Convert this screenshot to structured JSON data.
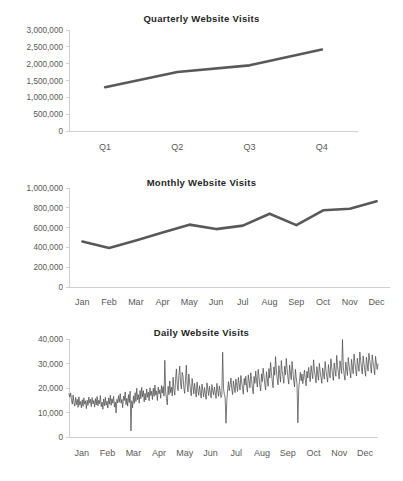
{
  "page": {
    "background": "#ffffff",
    "series_color": "#595959",
    "axis_color": "#d0d0d0",
    "label_color": "#595959"
  },
  "charts": [
    {
      "id": "quarterly",
      "title": "Quarterly Website Visits"
    },
    {
      "id": "monthly",
      "title": "Monthly Website Visits"
    },
    {
      "id": "daily",
      "title": "Daily Website Visits"
    }
  ],
  "chart_data": [
    {
      "type": "line",
      "title": "Quarterly Website Visits",
      "xlabel": "",
      "ylabel": "",
      "categories": [
        "Q1",
        "Q2",
        "Q3",
        "Q4"
      ],
      "values": [
        1300000,
        1750000,
        1950000,
        2420000
      ],
      "ylim": [
        0,
        3000000
      ],
      "ytick_labels": [
        "3,000,000",
        "2,500,000",
        "2,000,000",
        "1,500,000",
        "1,000,000",
        "500,000",
        "0"
      ],
      "yticks": [
        3000000,
        2500000,
        2000000,
        1500000,
        1000000,
        500000,
        0
      ],
      "grid": false,
      "legend": "none"
    },
    {
      "type": "line",
      "title": "Monthly Website Visits",
      "xlabel": "",
      "ylabel": "",
      "categories": [
        "Jan",
        "Feb",
        "Mar",
        "Apr",
        "May",
        "Jun",
        "Jul",
        "Aug",
        "Sep",
        "Oct",
        "Nov",
        "Dec"
      ],
      "values": [
        460000,
        395000,
        470000,
        550000,
        630000,
        585000,
        620000,
        740000,
        625000,
        775000,
        790000,
        865000
      ],
      "ylim": [
        0,
        1000000
      ],
      "ytick_labels": [
        "1,000,000",
        "800,000",
        "600,000",
        "400,000",
        "200,000",
        "0"
      ],
      "yticks": [
        1000000,
        800000,
        600000,
        400000,
        200000,
        0
      ],
      "grid": false,
      "legend": "none"
    },
    {
      "type": "line",
      "title": "Daily Website Visits",
      "xlabel": "",
      "ylabel": "",
      "categories": [
        "Jan",
        "Feb",
        "Mar",
        "Apr",
        "May",
        "Jun",
        "Jul",
        "Aug",
        "Sep",
        "Oct",
        "Nov",
        "Dec"
      ],
      "month_start_index": [
        0,
        31,
        59,
        90,
        120,
        151,
        181,
        212,
        243,
        273,
        304,
        334
      ],
      "ylim": [
        0,
        40000
      ],
      "ytick_labels": [
        "40,000",
        "30,000",
        "20,000",
        "10,000",
        "0"
      ],
      "yticks": [
        40000,
        30000,
        20000,
        10000,
        0
      ],
      "grid": false,
      "legend": "none",
      "values": [
        17600,
        16300,
        18000,
        15200,
        13400,
        17100,
        14000,
        12600,
        16200,
        13200,
        15400,
        12100,
        16400,
        13000,
        14500,
        11900,
        15200,
        12500,
        16000,
        13400,
        14800,
        11600,
        15000,
        12900,
        16300,
        13800,
        15400,
        12400,
        16100,
        13500,
        14900,
        12200,
        15700,
        13100,
        16500,
        12700,
        15000,
        13600,
        16900,
        12400,
        14200,
        11300,
        15500,
        12800,
        16200,
        13000,
        14600,
        11800,
        15900,
        13400,
        17000,
        12900,
        15600,
        13800,
        16600,
        12200,
        14300,
        9800,
        15400,
        13900,
        16900,
        14200,
        17700,
        13800,
        15300,
        12000,
        16700,
        14900,
        18400,
        13200,
        15800,
        12600,
        17300,
        14100,
        18700,
        2500,
        14800,
        11900,
        16800,
        13700,
        18100,
        14500,
        19900,
        15200,
        17300,
        13800,
        19000,
        15600,
        20200,
        16400,
        18900,
        14300,
        17800,
        15100,
        19600,
        16200,
        18300,
        14800,
        20100,
        16900,
        18700,
        15300,
        19900,
        16600,
        21200,
        17100,
        18800,
        14900,
        20400,
        17600,
        19300,
        15800,
        21000,
        17900,
        20600,
        16700,
        31300,
        18400,
        15600,
        13100,
        20700,
        17300,
        22900,
        18100,
        20300,
        16800,
        24400,
        19400,
        17100,
        23600,
        27800,
        21400,
        18900,
        25100,
        28900,
        22200,
        19600,
        26400,
        24800,
        20100,
        17800,
        23200,
        29300,
        21600,
        18400,
        25700,
        22100,
        19300,
        16800,
        23900,
        20800,
        17600,
        21900,
        18700,
        16300,
        22400,
        19100,
        17000,
        20900,
        18200,
        15900,
        21600,
        18900,
        16400,
        20200,
        17800,
        15400,
        22100,
        19400,
        16900,
        20700,
        18300,
        16000,
        21400,
        18800,
        17200,
        20400,
        18000,
        15700,
        21900,
        19200,
        16600,
        20800,
        18500,
        16100,
        17300,
        34600,
        19800,
        17400,
        15900,
        5600,
        14800,
        19200,
        22600,
        18900,
        21300,
        24100,
        19600,
        17300,
        22900,
        20400,
        18100,
        23700,
        21000,
        18600,
        24300,
        21700,
        19200,
        25100,
        22400,
        19800,
        17500,
        23900,
        21200,
        24800,
        20600,
        18300,
        25400,
        22800,
        20100,
        26200,
        23400,
        19900,
        17600,
        24700,
        21900,
        26900,
        23100,
        20400,
        27600,
        24300,
        21100,
        18800,
        25800,
        22600,
        28100,
        24900,
        21400,
        19200,
        26700,
        23800,
        20700,
        27900,
        24100,
        30400,
        26300,
        22900,
        20100,
        28600,
        25200,
        32800,
        27400,
        23600,
        21300,
        29100,
        25800,
        22400,
        31200,
        27100,
        24600,
        21900,
        28900,
        25400,
        32100,
        27800,
        24200,
        21600,
        29400,
        26100,
        23400,
        30800,
        26900,
        22800,
        20400,
        27600,
        24300,
        21700,
        5800,
        19400,
        23100,
        26400,
        22900,
        25700,
        21800,
        24600,
        27300,
        23400,
        20900,
        26800,
        24100,
        28400,
        25200,
        22600,
        29100,
        26300,
        23800,
        31500,
        27400,
        24900,
        22100,
        28700,
        25600,
        23200,
        30100,
        26800,
        24300,
        21900,
        28200,
        25900,
        23600,
        30800,
        27300,
        24700,
        22400,
        29600,
        26500,
        24100,
        31900,
        28400,
        25600,
        23100,
        30200,
        27100,
        24800,
        33300,
        29100,
        26400,
        23700,
        31100,
        28300,
        25900,
        39800,
        28700,
        25400,
        23200,
        30600,
        27800,
        25100,
        32400,
        29300,
        26700,
        24100,
        31700,
        28600,
        25800,
        33900,
        30400,
        27600,
        24900,
        32100,
        29400,
        26800,
        34700,
        31200,
        28300,
        25700,
        33100,
        30100,
        27400,
        24800,
        32600,
        29700,
        26900,
        34200,
        31400,
        28800,
        26100,
        33500,
        30700,
        28200,
        25400,
        32900,
        30200,
        27600,
        29800
      ]
    }
  ]
}
